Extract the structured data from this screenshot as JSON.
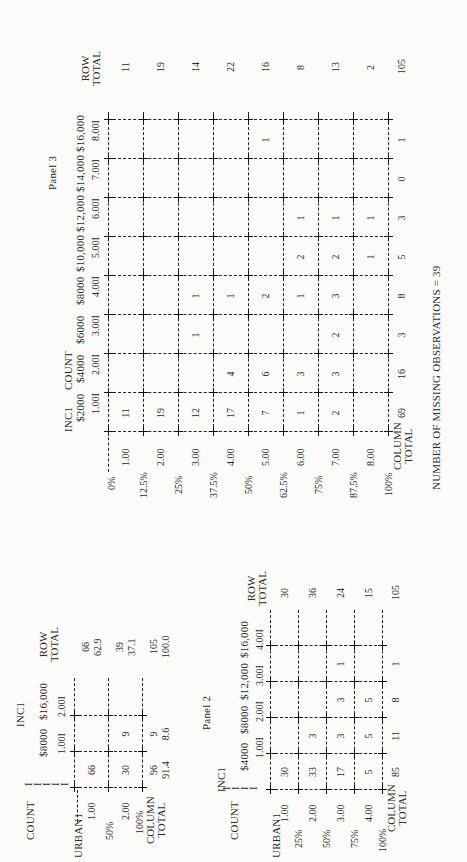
{
  "panel1": {
    "title": "INC1",
    "count_label": "COUNT",
    "row_var": "URBAN1",
    "col_headers": [
      {
        "value": "$8000",
        "code": "1.00I"
      },
      {
        "value": "$16,000",
        "code": "2.00I"
      }
    ],
    "row_total_label": [
      "ROW",
      "TOTAL"
    ],
    "rows": [
      {
        "code": "1.00",
        "pct": "",
        "cells": [
          "66",
          ""
        ],
        "total": "66",
        "total_pct": "62.9"
      },
      {
        "code": "2.00",
        "pct": "50%",
        "cells": [
          "30",
          "9"
        ],
        "total": "39",
        "total_pct": "37.1"
      }
    ],
    "column_total_label": [
      "COLUMN",
      "TOTAL"
    ],
    "bottom_pct": "100%",
    "column_totals": [
      "96",
      "9"
    ],
    "column_total_pcts": [
      "91.4",
      "8.6"
    ],
    "grand_total": "105",
    "grand_total_pct": "100.0"
  },
  "panel2": {
    "caption": "Panel 2",
    "title": "INC1",
    "count_label": "COUNT",
    "row_var": "URBAN1",
    "col_headers": [
      {
        "value": "$4000",
        "code": "1.00I"
      },
      {
        "value": "$8000",
        "code": "2.00I"
      },
      {
        "value": "$12,000",
        "code": "3.00I"
      },
      {
        "value": "$16,000",
        "code": "4.00I"
      }
    ],
    "row_total_label": [
      "ROW",
      "TOTAL"
    ],
    "rows": [
      {
        "code": "1.00",
        "pct": "25%",
        "cells": [
          "30",
          "",
          "",
          ""
        ],
        "total": "30"
      },
      {
        "code": "2.00",
        "pct": "50%",
        "cells": [
          "33",
          "3",
          "",
          ""
        ],
        "total": "36"
      },
      {
        "code": "3.00",
        "pct": "75%",
        "cells": [
          "17",
          "3",
          "3",
          "1"
        ],
        "total": "24"
      },
      {
        "code": "4.00",
        "pct": "100%",
        "cells": [
          "5",
          "5",
          "5",
          ""
        ],
        "total": "15"
      }
    ],
    "column_total_label": [
      "COLUMN",
      "TOTAL"
    ],
    "column_totals": [
      "85",
      "11",
      "8",
      "1"
    ],
    "grand_total": "105"
  },
  "panel3": {
    "caption": "Panel 3",
    "title": "INC1",
    "count_label": "COUNT",
    "top_pct": "0%",
    "col_headers": [
      {
        "value": "$2000",
        "code": "1.00I"
      },
      {
        "value": "$4000",
        "code": "2.00I"
      },
      {
        "value": "$6000",
        "code": "3.00I"
      },
      {
        "value": "$8000",
        "code": "4.00I"
      },
      {
        "value": "$10,000",
        "code": "5.00I"
      },
      {
        "value": "$12,000",
        "code": "6.00I"
      },
      {
        "value": "$14,000",
        "code": "7.00I"
      },
      {
        "value": "$16,000",
        "code": "8.00I"
      }
    ],
    "row_total_label": [
      "ROW",
      "TOTAL"
    ],
    "rows": [
      {
        "code": "1.00",
        "pct": "12.5%",
        "cells": [
          "11",
          "",
          "",
          "",
          "",
          "",
          "",
          ""
        ],
        "total": "11"
      },
      {
        "code": "2.00",
        "pct": "25%",
        "cells": [
          "19",
          "",
          "",
          "",
          "",
          "",
          "",
          ""
        ],
        "total": "19"
      },
      {
        "code": "3.00",
        "pct": "37.5%",
        "cells": [
          "12",
          "",
          "1",
          "1",
          "",
          "",
          "",
          ""
        ],
        "total": "14"
      },
      {
        "code": "4.00",
        "pct": "50%",
        "cells": [
          "17",
          "4",
          "",
          "1",
          "",
          "",
          "",
          ""
        ],
        "total": "22"
      },
      {
        "code": "5.00",
        "pct": "62.5%",
        "cells": [
          "7",
          "6",
          "",
          "2",
          "",
          "",
          "",
          "1"
        ],
        "total": "16"
      },
      {
        "code": "6.00",
        "pct": "75%",
        "cells": [
          "1",
          "3",
          "",
          "1",
          "2",
          "1",
          "",
          ""
        ],
        "total": "8"
      },
      {
        "code": "7.00",
        "pct": "87.5%",
        "cells": [
          "2",
          "3",
          "2",
          "3",
          "2",
          "1",
          "",
          ""
        ],
        "total": "13"
      },
      {
        "code": "8.00",
        "pct": "100%",
        "cells": [
          "",
          "",
          "",
          "",
          "1",
          "1",
          "",
          ""
        ],
        "total": "2"
      }
    ],
    "column_total_label": [
      "COLUMN",
      "TOTAL"
    ],
    "column_totals": [
      "69",
      "16",
      "3",
      "8",
      "5",
      "3",
      "0",
      "1"
    ],
    "grand_total": "105",
    "footer": "NUMBER OF MISSING OBSERVATIONS = 39"
  },
  "chart_data": [
    {
      "type": "table",
      "title": "INC1 by URBAN1 (2 income categories)",
      "columns": [
        "$8000",
        "$16,000",
        "ROW TOTAL"
      ],
      "rows": [
        {
          "label": "1.00",
          "values": [
            66,
            null,
            66
          ],
          "row_pct": 62.9
        },
        {
          "label": "2.00",
          "values": [
            30,
            9,
            39
          ],
          "row_pct": 37.1
        }
      ],
      "column_totals": [
        96,
        9,
        105
      ],
      "column_total_pcts": [
        91.4,
        8.6,
        100.0
      ]
    },
    {
      "type": "table",
      "title": "Panel 2: INC1 by URBAN1 (4 income categories)",
      "columns": [
        "$4000",
        "$8000",
        "$12,000",
        "$16,000",
        "ROW TOTAL"
      ],
      "rows": [
        {
          "label": "1.00",
          "values": [
            30,
            null,
            null,
            null,
            30
          ]
        },
        {
          "label": "2.00",
          "values": [
            33,
            3,
            null,
            null,
            36
          ]
        },
        {
          "label": "3.00",
          "values": [
            17,
            3,
            3,
            1,
            24
          ]
        },
        {
          "label": "4.00",
          "values": [
            5,
            5,
            5,
            null,
            15
          ]
        }
      ],
      "column_totals": [
        85,
        11,
        8,
        1,
        105
      ]
    },
    {
      "type": "table",
      "title": "Panel 3: INC1 by URBAN (8 income categories)",
      "columns": [
        "$2000",
        "$4000",
        "$6000",
        "$8000",
        "$10,000",
        "$12,000",
        "$14,000",
        "$16,000",
        "ROW TOTAL"
      ],
      "rows": [
        {
          "label": "1.00",
          "values": [
            11,
            null,
            null,
            null,
            null,
            null,
            null,
            null,
            11
          ]
        },
        {
          "label": "2.00",
          "values": [
            19,
            null,
            null,
            null,
            null,
            null,
            null,
            null,
            19
          ]
        },
        {
          "label": "3.00",
          "values": [
            12,
            null,
            1,
            1,
            null,
            null,
            null,
            null,
            14
          ]
        },
        {
          "label": "4.00",
          "values": [
            17,
            4,
            null,
            1,
            null,
            null,
            null,
            null,
            22
          ]
        },
        {
          "label": "5.00",
          "values": [
            7,
            6,
            null,
            2,
            null,
            null,
            null,
            1,
            16
          ]
        },
        {
          "label": "6.00",
          "values": [
            1,
            3,
            null,
            1,
            2,
            1,
            null,
            null,
            8
          ]
        },
        {
          "label": "7.00",
          "values": [
            2,
            3,
            2,
            3,
            2,
            1,
            null,
            null,
            13
          ]
        },
        {
          "label": "8.00",
          "values": [
            null,
            null,
            null,
            null,
            1,
            1,
            null,
            null,
            2
          ]
        }
      ],
      "column_totals": [
        69,
        16,
        3,
        8,
        5,
        3,
        0,
        1,
        105
      ],
      "annotation": "NUMBER OF MISSING OBSERVATIONS = 39"
    }
  ]
}
